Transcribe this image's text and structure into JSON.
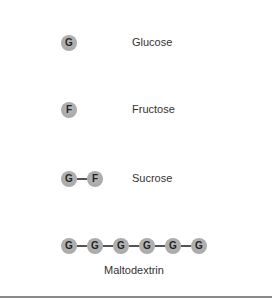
{
  "diagram": {
    "title": "",
    "rows": [
      {
        "name": "glucose",
        "units": [
          "G"
        ],
        "label": "Glucose"
      },
      {
        "name": "fructose",
        "units": [
          "F"
        ],
        "label": "Fructose"
      },
      {
        "name": "sucrose",
        "units": [
          "G",
          "F"
        ],
        "label": "Sucrose"
      },
      {
        "name": "maltodextrin",
        "units": [
          "G",
          "G",
          "G",
          "G",
          "G",
          "G"
        ],
        "label": "Maltodextrin"
      }
    ],
    "colors": {
      "unit_fill": "#b0b0b0",
      "unit_text": "#222222",
      "bond": "#555555",
      "rule": "#8a8a8a"
    }
  }
}
